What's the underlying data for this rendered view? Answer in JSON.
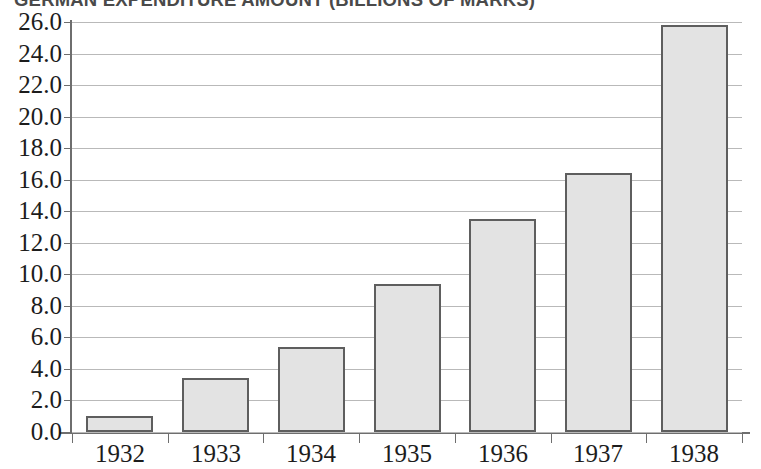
{
  "chart_data": {
    "type": "bar",
    "title": "GERMAN EXPENDITURE AMOUNT (BILLIONS OF MARKS)",
    "xlabel": "",
    "ylabel": "",
    "categories": [
      "1932",
      "1933",
      "1934",
      "1935",
      "1936",
      "1937",
      "1938"
    ],
    "values": [
      1.0,
      3.4,
      5.4,
      9.4,
      13.5,
      16.4,
      25.8
    ],
    "series": [
      {
        "name": "German expenditure",
        "values": [
          1.0,
          3.4,
          5.4,
          9.4,
          13.5,
          16.4,
          25.8
        ]
      }
    ],
    "ylim": [
      0.0,
      26.0
    ],
    "ytick_step": 2.0,
    "ytick_labels": [
      "0.0",
      "2.0",
      "4.0",
      "6.0",
      "8.0",
      "10.0",
      "12.0",
      "14.0",
      "16.0",
      "18.0",
      "20.0",
      "22.0",
      "24.0",
      "26.0"
    ],
    "ytick_values": [
      0,
      2,
      4,
      6,
      8,
      10,
      12,
      14,
      16,
      18,
      20,
      22,
      24,
      26
    ],
    "grid": true,
    "grid_axis": "y",
    "legend": false,
    "legend_position": "none",
    "bar_fill_color": "#e3e3e3",
    "bar_border_color": "#5e5e5e",
    "gridline_color": "#b9b9b9",
    "axis_color": "#6e6e6e",
    "text_color": "#1c1c1c",
    "background_color": "#ffffff",
    "annotations": []
  }
}
